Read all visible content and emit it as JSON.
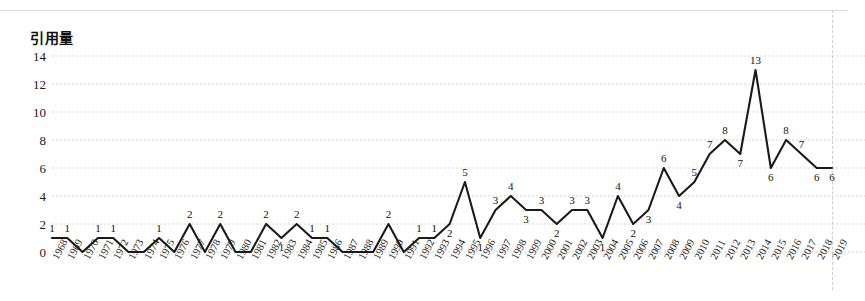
{
  "figure": {
    "y_axis_title": "引用量",
    "has_top_rule": true,
    "has_right_dashed_rule": true,
    "line_color": "#1a1a1a",
    "grid_color": "#c8c8c8",
    "background": "#ffffff"
  },
  "chart_data": {
    "type": "line",
    "title": "",
    "subtitle": "",
    "xlabel": "",
    "ylabel": "引用量",
    "ylim": [
      0,
      14
    ],
    "yticks": [
      0,
      2,
      4,
      6,
      8,
      10,
      12,
      14
    ],
    "grid": true,
    "grid_axis": "y",
    "legend": "none",
    "show_data_labels": true,
    "marker": "none",
    "categories": [
      "1968",
      "1969",
      "1970",
      "1971",
      "1972",
      "1973",
      "1974",
      "1975",
      "1976",
      "1977",
      "1978",
      "1979",
      "1980",
      "1981",
      "1982",
      "1983",
      "1984",
      "1985",
      "1986",
      "1987",
      "1988",
      "1989",
      "1990",
      "1991",
      "1992",
      "1993",
      "1994",
      "1995",
      "1996",
      "1997",
      "1998",
      "1999",
      "2000",
      "2001",
      "2002",
      "2003",
      "2004",
      "2005",
      "2006",
      "2007",
      "2008",
      "2009",
      "2010",
      "2011",
      "2012",
      "2013",
      "2014",
      "2015",
      "2016",
      "2017",
      "2018",
      "2019"
    ],
    "values": [
      1,
      1,
      0,
      1,
      1,
      0,
      0,
      1,
      0,
      2,
      0,
      2,
      0,
      0,
      2,
      1,
      2,
      1,
      1,
      0,
      0,
      0,
      2,
      0,
      1,
      1,
      2,
      5,
      1,
      3,
      4,
      3,
      3,
      2,
      3,
      3,
      1,
      4,
      2,
      3,
      6,
      4,
      5,
      7,
      8,
      7,
      13,
      6,
      8,
      7,
      6,
      6
    ],
    "labels_shown": [
      "1",
      "1",
      "",
      "1",
      "1",
      "",
      "",
      "1",
      "",
      "2",
      "",
      "2",
      "",
      "",
      "2",
      "1",
      "2",
      "1",
      "1",
      "",
      "",
      "",
      "2",
      "",
      "1",
      "1",
      "2",
      "5",
      "1",
      "3",
      "4",
      "3",
      "3",
      "2",
      "3",
      "3",
      "1",
      "4",
      "2",
      "3",
      "6",
      "4",
      "5",
      "7",
      "8",
      "7",
      "13",
      "6",
      "8",
      "7",
      "6",
      "6"
    ],
    "label_positions": [
      "above",
      "above",
      "none",
      "above",
      "above",
      "none",
      "none",
      "above",
      "none",
      "above",
      "none",
      "above",
      "none",
      "none",
      "above",
      "below",
      "above",
      "above",
      "above",
      "none",
      "none",
      "none",
      "above",
      "none",
      "above",
      "above",
      "below",
      "above",
      "below",
      "above",
      "above",
      "below",
      "above",
      "below",
      "above",
      "above",
      "below",
      "above",
      "below",
      "below",
      "above",
      "below",
      "above",
      "above",
      "above",
      "below",
      "above",
      "below",
      "above",
      "above",
      "below",
      "below"
    ]
  }
}
